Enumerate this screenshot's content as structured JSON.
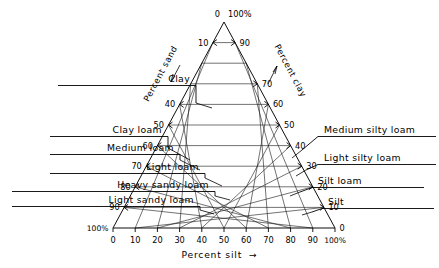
{
  "figure": {
    "kind": "soil-texture-ternary-triangle",
    "background_color": "#ffffff",
    "ink_color": "#000000"
  },
  "axes": {
    "bottom": {
      "title": "Percent silt",
      "arrow_glyph": "→",
      "ticks": [
        "0",
        "10",
        "20",
        "30",
        "40",
        "50",
        "60",
        "70",
        "80",
        "90",
        "100%"
      ]
    },
    "left": {
      "title": "Percent sand",
      "arrow_direction": "down-left",
      "ticks": [
        "0",
        "10",
        "40",
        "50",
        "60",
        "70",
        "80",
        "90",
        "100%"
      ]
    },
    "right": {
      "title": "Percent clay",
      "arrow_direction": "up-right",
      "ticks": [
        "100%",
        "90",
        "70",
        "60",
        "50",
        "40",
        "30",
        "20",
        "10",
        "0"
      ]
    }
  },
  "apex": {
    "left_value": "0",
    "right_value": "100%"
  },
  "left_ticks": [
    {
      "value": "10",
      "y_frac": 0.1
    },
    {
      "value": "40",
      "y_frac": 0.4
    },
    {
      "value": "50",
      "y_frac": 0.5
    },
    {
      "value": "60",
      "y_frac": 0.6
    },
    {
      "value": "70",
      "y_frac": 0.7
    },
    {
      "value": "80",
      "y_frac": 0.8
    },
    {
      "value": "90",
      "y_frac": 0.9
    },
    {
      "value": "100%",
      "y_frac": 1.0
    }
  ],
  "right_ticks": [
    {
      "value": "90",
      "y_frac": 0.1
    },
    {
      "value": "70",
      "y_frac": 0.3
    },
    {
      "value": "60",
      "y_frac": 0.4
    },
    {
      "value": "50",
      "y_frac": 0.5
    },
    {
      "value": "40",
      "y_frac": 0.6
    },
    {
      "value": "30",
      "y_frac": 0.7
    },
    {
      "value": "20",
      "y_frac": 0.8
    },
    {
      "value": "10",
      "y_frac": 0.9
    },
    {
      "value": "0",
      "y_frac": 1.0
    }
  ],
  "bottom_ticks": [
    {
      "value": "0",
      "x_frac": 0.0
    },
    {
      "value": "10",
      "x_frac": 0.1
    },
    {
      "value": "20",
      "x_frac": 0.2
    },
    {
      "value": "30",
      "x_frac": 0.3
    },
    {
      "value": "40",
      "x_frac": 0.4
    },
    {
      "value": "50",
      "x_frac": 0.5
    },
    {
      "value": "60",
      "x_frac": 0.6
    },
    {
      "value": "70",
      "x_frac": 0.7
    },
    {
      "value": "80",
      "x_frac": 0.8
    },
    {
      "value": "90",
      "x_frac": 0.9
    },
    {
      "value": "100%",
      "x_frac": 1.0
    }
  ],
  "left_categories": [
    {
      "id": "clay",
      "label": "Clay"
    },
    {
      "id": "clay-loam",
      "label": "Clay loam"
    },
    {
      "id": "medium-loam",
      "label": "Medium  loam"
    },
    {
      "id": "light-loam",
      "label": "Light  loam"
    },
    {
      "id": "heavy-sandy-loam",
      "label": "Heavy sandy loam"
    },
    {
      "id": "light-sandy-loam",
      "label": "Light  sandy  loam"
    }
  ],
  "right_categories": [
    {
      "id": "medium-silty-loam",
      "label": "Medium  silty  loam"
    },
    {
      "id": "light-silty-loam",
      "label": "Light  silty  loam"
    },
    {
      "id": "silt-loam",
      "label": "Silt  loam"
    },
    {
      "id": "silt",
      "label": "Silt"
    }
  ],
  "chart_data": {
    "type": "ternary",
    "title": "",
    "axis_titles": {
      "bottom": "Percent silt",
      "left": "Percent sand",
      "right": "Percent clay"
    },
    "grid": true,
    "grid_step": 10,
    "range": [
      0,
      100
    ],
    "classes": [
      "Clay",
      "Clay loam",
      "Medium loam",
      "Light loam",
      "Heavy sandy loam",
      "Light sandy loam",
      "Medium silty loam",
      "Light silty loam",
      "Silt loam",
      "Silt"
    ],
    "class_boundaries_percent_sand": [
      40,
      50,
      60,
      70,
      80,
      90
    ],
    "class_boundaries_percent_clay": [
      40,
      30,
      20,
      10
    ]
  }
}
